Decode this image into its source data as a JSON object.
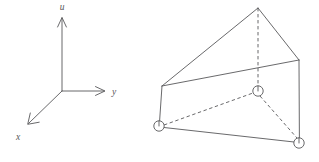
{
  "figure": {
    "background_color": "#ffffff",
    "line_color": "#58585a",
    "panels": [
      {
        "name": "coordinate-axes",
        "description": "Three-dimensional right-handed coordinate axes with arrowheads"
      },
      {
        "name": "prism-diagram",
        "description": "Triangular prism in oblique projection with three circled nodes"
      }
    ]
  },
  "axes": {
    "origin": {
      "x": 62,
      "y": 91
    },
    "items": [
      {
        "id": "u",
        "label": "u",
        "direction": "up",
        "tip": {
          "x": 62,
          "y": 18
        },
        "label_pos": {
          "x": 62,
          "y": 10
        }
      },
      {
        "id": "y",
        "label": "y",
        "direction": "right",
        "tip": {
          "x": 104,
          "y": 91
        },
        "label_pos": {
          "x": 112,
          "y": 94
        }
      },
      {
        "id": "x",
        "label": "x",
        "direction": "down-left",
        "tip": {
          "x": 28,
          "y": 124
        },
        "label_pos": {
          "x": 18,
          "y": 139
        }
      }
    ]
  },
  "prism": {
    "vertices": {
      "apex_top": {
        "x": 258,
        "y": 8
      },
      "left_top": {
        "x": 162,
        "y": 86
      },
      "right_top": {
        "x": 299,
        "y": 60
      },
      "left_bottom": {
        "x": 159,
        "y": 126
      },
      "mid_bottom": {
        "x": 258,
        "y": 91
      },
      "right_bottom": {
        "x": 299,
        "y": 143
      }
    },
    "solid_edges": [
      {
        "from": "left_top",
        "to": "apex_top"
      },
      {
        "from": "apex_top",
        "to": "right_top"
      },
      {
        "from": "left_top",
        "to": "right_top"
      },
      {
        "from": "left_top",
        "to": "left_bottom"
      },
      {
        "from": "right_top",
        "to": "right_bottom"
      },
      {
        "from": "left_bottom",
        "to": "right_bottom"
      }
    ],
    "dashed_edges": [
      {
        "from": "apex_top",
        "to": "mid_bottom"
      },
      {
        "from": "left_bottom",
        "to": "mid_bottom"
      },
      {
        "from": "mid_bottom",
        "to": "right_bottom"
      }
    ],
    "nodes": [
      {
        "id": "node-left",
        "at": "left_bottom",
        "radius": 5.2
      },
      {
        "id": "node-middle",
        "at": "mid_bottom",
        "radius": 5.2
      },
      {
        "id": "node-right",
        "at": "right_bottom",
        "radius": 5.2
      }
    ]
  }
}
